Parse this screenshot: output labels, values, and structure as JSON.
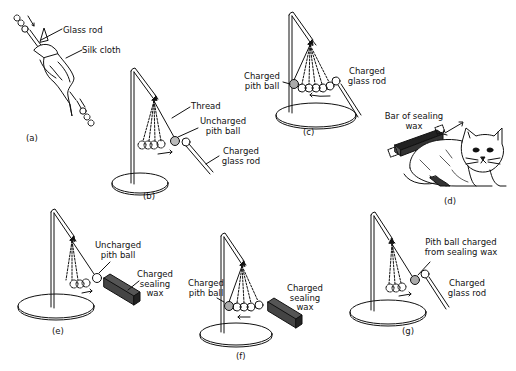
{
  "figure": {
    "panels": [
      {
        "id": "a",
        "caption": "(a)",
        "labels": [
          "Glass rod",
          "Silk cloth"
        ]
      },
      {
        "id": "b",
        "caption": "(b)",
        "labels": [
          "Thread",
          "Uncharged",
          "pith ball",
          "Charged",
          "glass rod"
        ]
      },
      {
        "id": "c",
        "caption": "(c)",
        "labels": [
          "Charged",
          "pith ball",
          "Charged",
          "glass rod"
        ]
      },
      {
        "id": "d",
        "caption": "(d)",
        "labels": [
          "Bar of sealing",
          "wax"
        ]
      },
      {
        "id": "e",
        "caption": "(e)",
        "labels": [
          "Uncharged",
          "pith ball",
          "Charged",
          "sealing",
          "wax"
        ]
      },
      {
        "id": "f",
        "caption": "(f)",
        "labels": [
          "Charged",
          "pith ball",
          "Charged",
          "sealing",
          "wax"
        ]
      },
      {
        "id": "g",
        "caption": "(g)",
        "labels": [
          "Pith ball charged",
          "from sealing wax",
          "Charged",
          "glass rod"
        ]
      }
    ]
  }
}
